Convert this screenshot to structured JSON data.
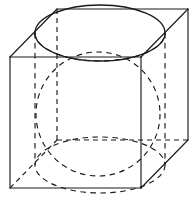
{
  "figure": {
    "caption": "",
    "background_color": "#ffffff",
    "line_color": "#1a1a1a",
    "canvas": {
      "width": 196,
      "height": 200
    },
    "projection": "oblique-cabinet",
    "solids": [
      {
        "name": "cube",
        "edge_style": "solid-visible-dashed-hidden"
      },
      {
        "name": "sphere",
        "edge_style": "dashed"
      },
      {
        "name": "cylinder",
        "edge_style": "mixed-solid-dashed"
      }
    ]
  },
  "geometry": {
    "cube": {
      "front_top_left": [
        10,
        57
      ],
      "front_top_right": [
        141,
        57
      ],
      "front_bottom_left": [
        10,
        188
      ],
      "front_bottom_right": [
        141,
        188
      ],
      "back_top_left": [
        57,
        9
      ],
      "back_top_right": [
        188,
        9
      ],
      "back_bottom_left": [
        57,
        140
      ],
      "back_bottom_right": [
        188,
        140
      ],
      "visible_edges": [
        "front-top",
        "front-right",
        "front-bottom",
        "front-left",
        "back-top",
        "back-right",
        "back-bottom-right-diagonal",
        "top-left-diagonal",
        "top-right-diagonal",
        "bottom-right-diagonal"
      ],
      "hidden_edges": [
        "back-left-vertical",
        "back-bottom-left-horizontal",
        "back-bottom-depth",
        "bottom-left-diagonal"
      ]
    },
    "sphere": {
      "center": [
        98,
        114
      ],
      "radius": 62,
      "style": "dashed"
    },
    "cylinder": {
      "top_ellipse": {
        "center": [
          100,
          33
        ],
        "rx": 65,
        "ry": 28
      },
      "bottom_ellipse": {
        "center": [
          100,
          165
        ],
        "rx": 65,
        "ry": 28
      },
      "left_wall_x": 35,
      "right_wall_x": 165,
      "height": 132
    }
  },
  "labels": {
    "vertices": [],
    "dimensions": [],
    "annotations": []
  }
}
